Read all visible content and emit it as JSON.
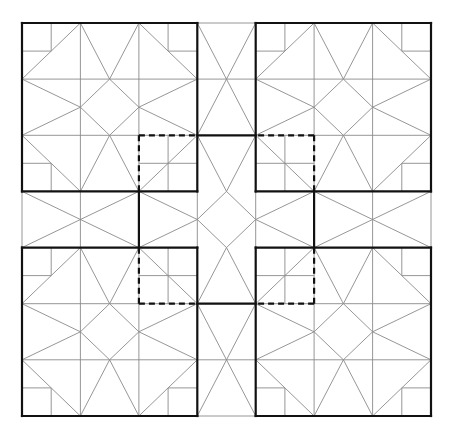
{
  "diagram": {
    "title": "Quilt block tessellation",
    "origin": [
      22,
      23
    ],
    "step": [
      58.43,
      56.14
    ],
    "grid_size": 7,
    "colors": {
      "thin": "#8a8a8a",
      "thick": "#111111",
      "background": "#ffffff"
    },
    "block_thin_lines": [
      [
        0,
        1,
        3,
        1
      ],
      [
        0,
        2,
        3,
        2
      ],
      [
        1,
        0,
        1,
        3
      ],
      [
        2,
        0,
        2,
        3
      ],
      [
        0.5,
        0,
        0.5,
        0.5
      ],
      [
        0,
        0.5,
        0.5,
        0.5
      ],
      [
        2.5,
        0,
        2.5,
        0.5
      ],
      [
        2.5,
        0.5,
        3,
        0.5
      ],
      [
        0.5,
        2.5,
        0.5,
        3
      ],
      [
        0,
        2.5,
        0.5,
        2.5
      ],
      [
        2.5,
        2,
        2.5,
        3
      ],
      [
        2,
        2.5,
        3,
        2.5
      ],
      [
        0,
        1,
        0.5,
        0.5
      ],
      [
        0.5,
        0.5,
        1,
        0
      ],
      [
        3,
        1,
        2.5,
        0.5
      ],
      [
        2.5,
        0.5,
        2,
        0
      ],
      [
        0,
        2,
        0.5,
        2.5
      ],
      [
        0.5,
        2.5,
        1,
        3
      ],
      [
        2,
        3,
        3,
        2
      ],
      [
        1,
        0,
        1.5,
        1
      ],
      [
        2,
        0,
        1.5,
        1
      ],
      [
        0,
        1,
        1,
        1.5
      ],
      [
        0,
        2,
        1,
        1.5
      ],
      [
        3,
        1,
        2,
        1.5
      ],
      [
        3,
        2,
        2,
        1.5
      ],
      [
        1.5,
        1,
        1,
        1.5
      ],
      [
        1,
        1.5,
        1.5,
        2
      ],
      [
        1.5,
        2,
        2,
        1.5
      ],
      [
        2,
        1.5,
        1.5,
        1
      ],
      [
        1.5,
        2,
        1,
        3
      ],
      [
        1.5,
        2,
        2,
        3
      ]
    ],
    "block_thick_lines": [
      [
        0,
        0,
        3,
        0
      ],
      [
        0,
        0,
        0,
        3
      ],
      [
        3,
        0,
        3,
        3
      ],
      [
        0,
        3,
        3,
        3
      ]
    ],
    "block_dashed_lines": [
      [
        2,
        2,
        3,
        2
      ],
      [
        2,
        2,
        2,
        3
      ]
    ],
    "center_thin_lines": [
      [
        3,
        0,
        4,
        0
      ],
      [
        3,
        7,
        4,
        7
      ],
      [
        0,
        3,
        0,
        4
      ],
      [
        7,
        3,
        7,
        4
      ],
      [
        3,
        0,
        4,
        2
      ],
      [
        4,
        0,
        3,
        2
      ],
      [
        3,
        1,
        4,
        1
      ],
      [
        3,
        5,
        4,
        7
      ],
      [
        4,
        5,
        3,
        7
      ],
      [
        3,
        6,
        4,
        6
      ],
      [
        0,
        3,
        2,
        4
      ],
      [
        0,
        4,
        2,
        3
      ],
      [
        1,
        3,
        1,
        4
      ],
      [
        5,
        3,
        7,
        4
      ],
      [
        5,
        4,
        7,
        3
      ],
      [
        6,
        3,
        6,
        4
      ],
      [
        3,
        2,
        3.5,
        3
      ],
      [
        4,
        2,
        3.5,
        3
      ],
      [
        3.5,
        3,
        4,
        3.5
      ],
      [
        4,
        3.5,
        3.5,
        4
      ],
      [
        3.5,
        4,
        3,
        3.5
      ],
      [
        3,
        3.5,
        3.5,
        3
      ],
      [
        3.5,
        4,
        3,
        5
      ],
      [
        3.5,
        4,
        4,
        5
      ],
      [
        2,
        3,
        3,
        3.5
      ],
      [
        2,
        4,
        3,
        3.5
      ],
      [
        5,
        3,
        4,
        3.5
      ],
      [
        5,
        4,
        4,
        3.5
      ],
      [
        3,
        3,
        3,
        4
      ],
      [
        4,
        3,
        4,
        4
      ],
      [
        2,
        3,
        2,
        4
      ],
      [
        5,
        3,
        5,
        4
      ]
    ],
    "center_thick_lines": [
      [
        3,
        2,
        4,
        2
      ],
      [
        3,
        5,
        4,
        5
      ],
      [
        2,
        3,
        2,
        4
      ],
      [
        5,
        3,
        5,
        4
      ]
    ]
  }
}
